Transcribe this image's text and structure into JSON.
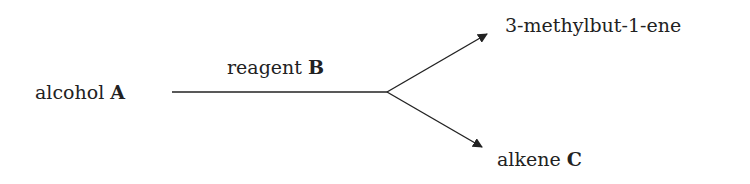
{
  "reactant": {
    "text": "alcohol",
    "label": "A"
  },
  "reagent": {
    "text": "reagent",
    "label": "B"
  },
  "products": [
    {
      "text": "3-methylbut-1-ene",
      "label": ""
    },
    {
      "text": "alkene",
      "label": "C"
    }
  ],
  "colors": {
    "line": "#222222",
    "text": "#222222"
  }
}
